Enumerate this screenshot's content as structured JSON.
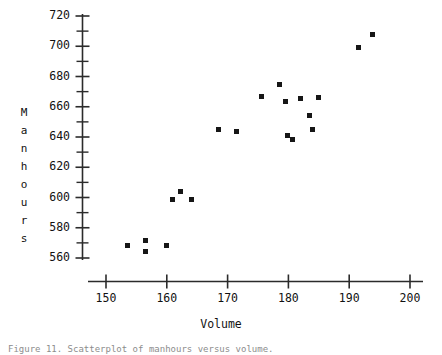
{
  "chart_data": {
    "type": "scatter",
    "title": "",
    "xlabel": "Volume",
    "ylabel": "Manhours",
    "xlim": [
      145,
      203
    ],
    "ylim": [
      552,
      726
    ],
    "grid": false,
    "legend": null,
    "x_ticks": [
      150,
      160,
      170,
      180,
      190,
      200
    ],
    "x_tick_labels": [
      "150",
      "160",
      "170",
      "180",
      "190",
      "200"
    ],
    "x_minor_ticks": [
      155,
      165,
      175,
      185,
      195
    ],
    "y_ticks": [
      560,
      580,
      600,
      620,
      640,
      660,
      680,
      700,
      720
    ],
    "y_tick_labels": [
      "560",
      "580",
      "600",
      "620",
      "640",
      "660",
      "680",
      "700",
      "720"
    ],
    "y_minor_ticks": [
      570,
      590,
      610,
      630,
      650,
      670,
      690,
      710
    ],
    "ylabel_chars": [
      "M",
      "a",
      "n",
      "h",
      "o",
      "u",
      "r",
      "s"
    ],
    "marker": "filled-square",
    "marker_color": "#161616",
    "axis_color": "#2b2b2b",
    "background_color": "#ffffff",
    "n_points": 20,
    "x": [
      153.6,
      156.5,
      156.5,
      160.0,
      162.3,
      160.9,
      164.0,
      168.5,
      171.5,
      175.5,
      178.5,
      179.5,
      179.9,
      180.7,
      182.0,
      183.5,
      184.0,
      185.0,
      191.6,
      193.8
    ],
    "y": [
      568.5,
      571.5,
      564.0,
      568.5,
      604.0,
      598.5,
      598.5,
      645.0,
      643.5,
      667.0,
      674.5,
      663.5,
      641.0,
      638.5,
      665.5,
      654.5,
      645.0,
      666.0,
      699.0,
      708.0
    ],
    "points": [
      {
        "x": 153.6,
        "y": 568.5
      },
      {
        "x": 156.5,
        "y": 571.5
      },
      {
        "x": 156.5,
        "y": 564.0
      },
      {
        "x": 160.0,
        "y": 568.5
      },
      {
        "x": 162.3,
        "y": 604.0
      },
      {
        "x": 160.9,
        "y": 598.5
      },
      {
        "x": 164.0,
        "y": 598.5
      },
      {
        "x": 168.5,
        "y": 645.0
      },
      {
        "x": 171.5,
        "y": 643.5
      },
      {
        "x": 175.5,
        "y": 667.0
      },
      {
        "x": 178.5,
        "y": 674.5
      },
      {
        "x": 179.5,
        "y": 663.5
      },
      {
        "x": 179.9,
        "y": 641.0
      },
      {
        "x": 180.7,
        "y": 638.5
      },
      {
        "x": 182.0,
        "y": 665.5
      },
      {
        "x": 183.5,
        "y": 654.5
      },
      {
        "x": 184.0,
        "y": 645.0
      },
      {
        "x": 185.0,
        "y": 666.0
      },
      {
        "x": 191.6,
        "y": 699.0
      },
      {
        "x": 193.8,
        "y": 708.0
      }
    ]
  },
  "caption": {
    "text": "Figure 11. Scatterplot of manhours versus volume."
  }
}
